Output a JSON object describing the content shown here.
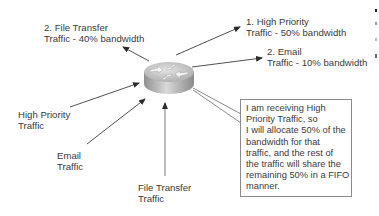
{
  "diagram": {
    "type": "qos-bandwidth-allocation",
    "router": {
      "icon": "router-icon",
      "center": [
        169,
        73
      ]
    },
    "outputs": [
      {
        "id": "out-high",
        "lines": [
          "1. High Priority",
          "Traffic - 50% bandwidth"
        ]
      },
      {
        "id": "out-email",
        "lines": [
          "2. Email",
          "Traffic - 10% bandwidth"
        ]
      },
      {
        "id": "out-file",
        "lines": [
          "2. File Transfer",
          "Traffic - 40% bandwidth"
        ]
      }
    ],
    "inputs": [
      {
        "id": "in-high",
        "lines": [
          "High Priority",
          "Traffic"
        ]
      },
      {
        "id": "in-email",
        "lines": [
          "Email",
          "Traffic"
        ]
      },
      {
        "id": "in-file",
        "lines": [
          "File Transfer",
          "Traffic"
        ]
      }
    ],
    "callout": {
      "lines": [
        "I am receiving High",
        "Priority Traffic, so",
        "I will allocate 50% of the",
        "bandwidth for that",
        "traffic, and the rest of",
        "the traffic will share the",
        "remaining 50% in a FIFO",
        "manner."
      ]
    },
    "colors": {
      "line": "#3c3c3c",
      "text": "#3a3a3a",
      "router_top": "#c8c8c8",
      "router_side": "#a9a9a9",
      "callout_border": "#8a8a8a"
    }
  }
}
